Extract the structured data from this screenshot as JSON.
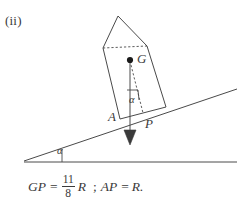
{
  "figure": {
    "part_label": "(ii)",
    "stroke_color": "#4a4a4a",
    "text_color": "#3a3a3a",
    "background": "#ffffff",
    "labels": {
      "centre_of_gravity": "G",
      "contact_point": "A",
      "foot_point": "P",
      "incline_angle": "α",
      "body_angle": "α"
    },
    "formula": {
      "lhs_1": "GP",
      "equals_1": "=",
      "fraction_numerator": "11",
      "fraction_denominator": "8",
      "radius_1": "R",
      "separator": ";",
      "lhs_2": "AP",
      "equals_2": "=",
      "radius_2": "R."
    },
    "geometry": {
      "prism_vertices": "103,48 118,16 147,46 166,107 120,119",
      "dashed_top": "103,48 147,46",
      "dashed_gp": "129,61 142,112",
      "weight_line": "129,61 130,142",
      "incline": "24,161 237,90",
      "ground": "24,162 237,162",
      "angle_tick": "63,162 61,151",
      "right_angle_box": "126,92 137,92 137,101 127,101"
    }
  }
}
